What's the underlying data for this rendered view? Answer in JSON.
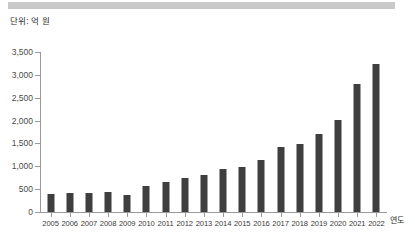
{
  "header": {
    "band_color": "#c9c9c9"
  },
  "unit_label": "단위: 억 원",
  "axis_title_x": "연도",
  "colors": {
    "bar": "#3f3f3f",
    "axis": "#9a9a9a",
    "tick_label": "#4a4a4a",
    "band": "#c9c9c9"
  },
  "chart_data": {
    "type": "bar",
    "title": "",
    "subtitle": "",
    "xlabel": "연도",
    "ylabel": "단위: 억 원",
    "ylim": [
      0,
      3500
    ],
    "ytick_labels": [
      "0",
      "500",
      "1,000",
      "1,500",
      "2,000",
      "2,500",
      "3,000",
      "3,500"
    ],
    "ytick_values": [
      0,
      500,
      1000,
      1500,
      2000,
      2500,
      3000,
      3500
    ],
    "grid": false,
    "legend": null,
    "categories": [
      "2005",
      "2006",
      "2007",
      "2008",
      "2009",
      "2010",
      "2011",
      "2012",
      "2013",
      "2014",
      "2015",
      "2016",
      "2017",
      "2018",
      "2019",
      "2020",
      "2021",
      "2022"
    ],
    "values": [
      395,
      415,
      415,
      440,
      370,
      560,
      655,
      755,
      805,
      945,
      995,
      1130,
      1420,
      1490,
      1705,
      2020,
      2800,
      3230
    ],
    "series": [
      {
        "name": "금액",
        "values": [
          395,
          415,
          415,
          440,
          370,
          560,
          655,
          755,
          805,
          945,
          995,
          1130,
          1420,
          1490,
          1705,
          2020,
          2800,
          3230
        ]
      }
    ]
  }
}
